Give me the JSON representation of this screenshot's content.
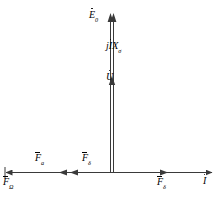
{
  "diagram": {
    "type": "phasor-vector-diagram",
    "title": "",
    "stroke_color": "#3a3a3a",
    "text_color": "#000000",
    "background": "#ffffff",
    "origin": {
      "x": 112,
      "y": 172
    },
    "labels": {
      "emf": {
        "base": "E",
        "sub": "0",
        "accent": "dot"
      },
      "reactance_drop": {
        "prefix": "j",
        "base": "I",
        "accent": "dot",
        "sub_base": "X",
        "sub": "σ"
      },
      "voltage": {
        "base": "U",
        "accent": "dot"
      },
      "force_a": {
        "base": "F",
        "sub": "a",
        "accent": "bar"
      },
      "force_delta_left": {
        "base": "F",
        "sub": "δ",
        "accent": "bar"
      },
      "force_omega": {
        "base": "F",
        "sub": "Ω",
        "accent": "bar"
      },
      "force_delta_right": {
        "base": "F",
        "sub": "δ",
        "accent": "bar"
      },
      "current": {
        "base": "I",
        "accent": "dot"
      }
    },
    "vectors": [
      {
        "name": "vertical-axis",
        "from": [
          112,
          172
        ],
        "to": [
          112,
          16
        ],
        "direction": "up",
        "style": "double-line"
      },
      {
        "name": "horizontal-axis-right",
        "from": [
          112,
          172
        ],
        "to": [
          213,
          172
        ],
        "direction": "right"
      },
      {
        "name": "horizontal-axis-left",
        "from": [
          112,
          172
        ],
        "to": [
          4,
          172
        ],
        "direction": "left"
      },
      {
        "name": "force-a-arrow",
        "from": [
          112,
          172
        ],
        "to": [
          67,
          172
        ],
        "direction": "left"
      },
      {
        "name": "force-delta-arrow",
        "from": [
          112,
          172
        ],
        "to": [
          78,
          172
        ],
        "direction": "left"
      },
      {
        "name": "force-delta-right-arrow",
        "from": [
          112,
          172
        ],
        "to": [
          167,
          172
        ],
        "direction": "right"
      },
      {
        "name": "voltage-tick",
        "at": [
          112,
          80
        ],
        "direction": "up"
      },
      {
        "name": "emf-tick",
        "at": [
          112,
          16
        ],
        "direction": "up"
      }
    ]
  }
}
